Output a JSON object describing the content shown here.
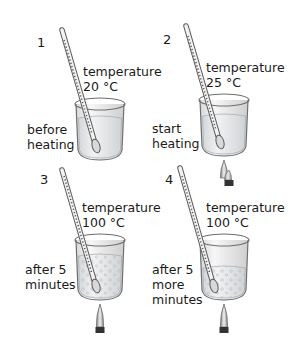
{
  "panels": [
    {
      "number": "1",
      "temp_label": "temperature",
      "temp_value": "20 °C",
      "caption": "before\nheating",
      "flame": false,
      "bubbles": "none"
    },
    {
      "number": "2",
      "temp_label": "temperature",
      "temp_value": "25 °C",
      "caption": "start\nheating",
      "flame": true,
      "bubbles": "none"
    },
    {
      "number": "3",
      "temp_label": "temperature",
      "temp_value": "100 °C",
      "caption": "after 5\nminutes",
      "flame": true,
      "bubbles": "many"
    },
    {
      "number": "4",
      "temp_label": "temperature",
      "temp_value": "100 °C",
      "caption": "after 5\nmore\nminutes",
      "flame": true,
      "bubbles": "many-lower-level"
    }
  ],
  "colors": {
    "glass": "#6e6e6e",
    "liquid": "#e9ecef",
    "text": "#1a1a1a",
    "burner": "#333333"
  }
}
